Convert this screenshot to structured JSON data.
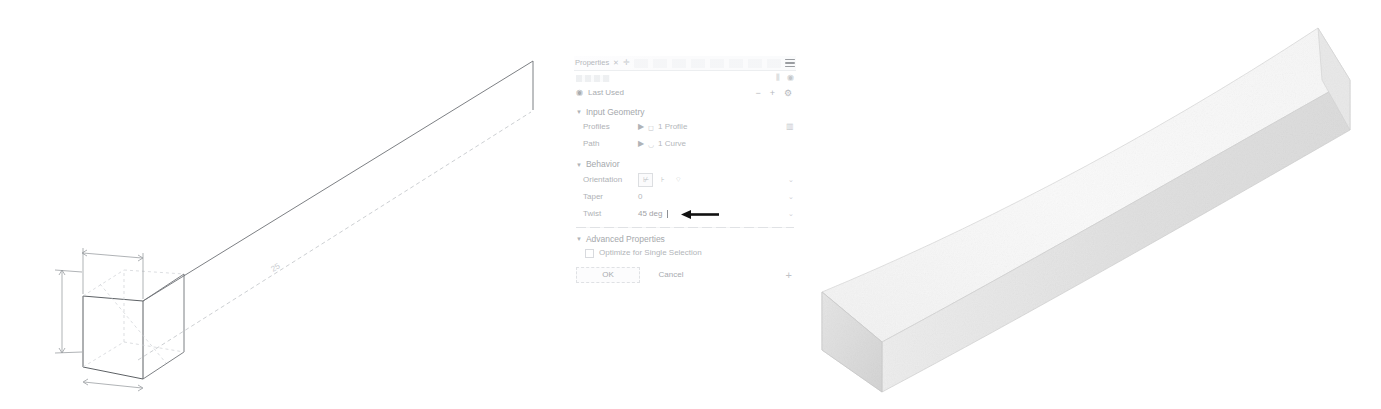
{
  "app": {
    "background_color": "#ffffff",
    "line_color": "#6e7276",
    "faint_line_color": "#cbced2"
  },
  "dialog": {
    "title": "Properties",
    "tab_close_glyph": "✕",
    "tab_pin_glyph": "✛",
    "menu_icon": "hamburger-menu-icon",
    "toolbar_icons": [
      "measure-icon",
      "visibility-icon"
    ],
    "last_used": {
      "label": "Last Used",
      "leading_icon": "history-icon",
      "actions": [
        "dash",
        "plus",
        "gear"
      ],
      "dash_glyph": "−",
      "plus_glyph": "+",
      "gear_glyph": "⚙"
    },
    "sections": [
      {
        "id": "input-geometry",
        "title": "Input Geometry",
        "expanded": true,
        "collapse_glyph": "▼",
        "rows": [
          {
            "label": "Profiles",
            "selector_glyph": "▶",
            "shape_glyph": "◻",
            "value": "1 Profile",
            "end_icon": "select-profile-icon"
          },
          {
            "label": "Path",
            "selector_glyph": "▶",
            "shape_glyph": "◡",
            "value": "1 Curve",
            "end_icon": ""
          }
        ]
      },
      {
        "id": "behavior",
        "title": "Behavior",
        "expanded": true,
        "collapse_glyph": "▼",
        "rows": [
          {
            "label": "Orientation",
            "type": "icon-group",
            "options": [
              {
                "name": "perpendicular-icon",
                "glyph": "⊬",
                "active": true
              },
              {
                "name": "parallel-icon",
                "glyph": "⊦",
                "active": false
              },
              {
                "name": "freeform-icon",
                "glyph": "⌔",
                "active": false
              }
            ],
            "caret": "⌄"
          },
          {
            "label": "Taper",
            "type": "text",
            "value": "0",
            "caret": "⌄"
          },
          {
            "label": "Twist",
            "type": "text-focused",
            "value": "45 deg",
            "caret": "⌄",
            "annotation": "arrow-pointing-left-at-twist-value"
          }
        ]
      },
      {
        "id": "advanced-properties",
        "title": "Advanced Properties",
        "expanded": true,
        "collapse_glyph": "▼",
        "checkbox": {
          "label": "Optimize for Single Selection",
          "checked": false
        }
      }
    ],
    "buttons": {
      "ok": "OK",
      "cancel": "Cancel",
      "expand_glyph": "+"
    }
  },
  "viewport_left": {
    "name": "sweep-input-wireframe",
    "description": "Isometric wireframe: square profile sketch at origin with dimension witness lines, and a long straight sweep path line extending to the upper right",
    "path_dimension_label": "25"
  },
  "viewport_right": {
    "name": "sweep-result-solid",
    "description": "Shaded isometric solid: long square bar swept along the path with a 45 degree twist",
    "face_top_color": "#fafafa",
    "face_side_color": "#e3e3e3",
    "face_end_color": "#efefef"
  }
}
